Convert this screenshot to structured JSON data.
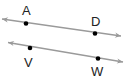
{
  "diagram": {
    "type": "parallel-lines",
    "colors": {
      "line": "#9a9a9a",
      "point": "#000000",
      "label": "#222222"
    },
    "lines": [
      {
        "name": "line-AD",
        "x1": 2,
        "y1": 19,
        "x2": 121,
        "y2": 36,
        "points": [
          {
            "label": "A",
            "x": 26,
            "y": 23.5,
            "lx": 22,
            "ly": 15
          },
          {
            "label": "D",
            "x": 95,
            "y": 33.5,
            "lx": 91,
            "ly": 26
          }
        ]
      },
      {
        "name": "line-VW",
        "x1": 8,
        "y1": 42.5,
        "x2": 123,
        "y2": 62,
        "points": [
          {
            "label": "V",
            "x": 30,
            "y": 48,
            "lx": 24,
            "ly": 67
          },
          {
            "label": "W",
            "x": 98,
            "y": 58.5,
            "lx": 91,
            "ly": 76
          }
        ]
      }
    ]
  }
}
